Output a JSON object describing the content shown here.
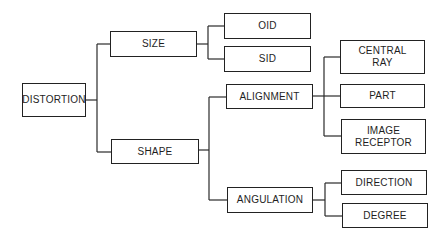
{
  "diagram": {
    "type": "tree",
    "root": "DISTORTION",
    "nodes": {
      "distortion": "DISTORTION",
      "size": "SIZE",
      "shape": "SHAPE",
      "oid": "OID",
      "sid": "SID",
      "alignment": "ALIGNMENT",
      "angulation": "ANGULATION",
      "central_ray": "CENTRAL RAY",
      "part": "PART",
      "image_receptor": "IMAGE RECEPTOR",
      "direction": "DIRECTION",
      "degree": "DEGREE"
    },
    "edges": [
      [
        "DISTORTION",
        "SIZE"
      ],
      [
        "DISTORTION",
        "SHAPE"
      ],
      [
        "SIZE",
        "OID"
      ],
      [
        "SIZE",
        "SID"
      ],
      [
        "SHAPE",
        "ALIGNMENT"
      ],
      [
        "SHAPE",
        "ANGULATION"
      ],
      [
        "ALIGNMENT",
        "CENTRAL RAY"
      ],
      [
        "ALIGNMENT",
        "PART"
      ],
      [
        "ALIGNMENT",
        "IMAGE RECEPTOR"
      ],
      [
        "ANGULATION",
        "DIRECTION"
      ],
      [
        "ANGULATION",
        "DEGREE"
      ]
    ],
    "line_color": "#2a2a2a",
    "box_border_color": "#222222",
    "background_color": "#ffffff"
  }
}
